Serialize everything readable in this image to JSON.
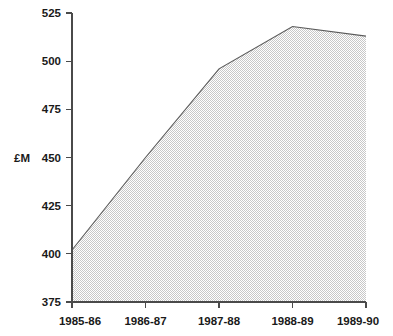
{
  "chart_data": {
    "type": "area",
    "title": "",
    "subtitle": "",
    "xlabel": "",
    "ylabel": "£M",
    "categories": [
      "1985-86",
      "1986-87",
      "1987-88",
      "1988-89",
      "1989-90"
    ],
    "values": [
      402,
      450,
      496,
      518,
      513
    ],
    "series": [
      {
        "name": "",
        "values": [
          402,
          450,
          496,
          518,
          513
        ]
      }
    ],
    "ylim": [
      375,
      525
    ],
    "yticks": [
      375,
      400,
      425,
      450,
      475,
      500,
      525
    ],
    "ytick_labels": [
      "375",
      "400",
      "425",
      "450",
      "475",
      "500",
      "525"
    ],
    "xtick_labels": [
      "1985-86",
      "1986-87",
      "1987-88",
      "1988-89",
      "1989-90"
    ],
    "grid": false,
    "legend": false,
    "legend_position": "none",
    "annotations": [],
    "colors": {
      "fill": "#e0e0e0",
      "line": "#5a5a5a",
      "axis": "#4a4a4a",
      "text": "#1a1a1a",
      "background": "#ffffff"
    }
  },
  "axis": {
    "unit_label": "£M",
    "unit_attached_to_tick": "450"
  }
}
